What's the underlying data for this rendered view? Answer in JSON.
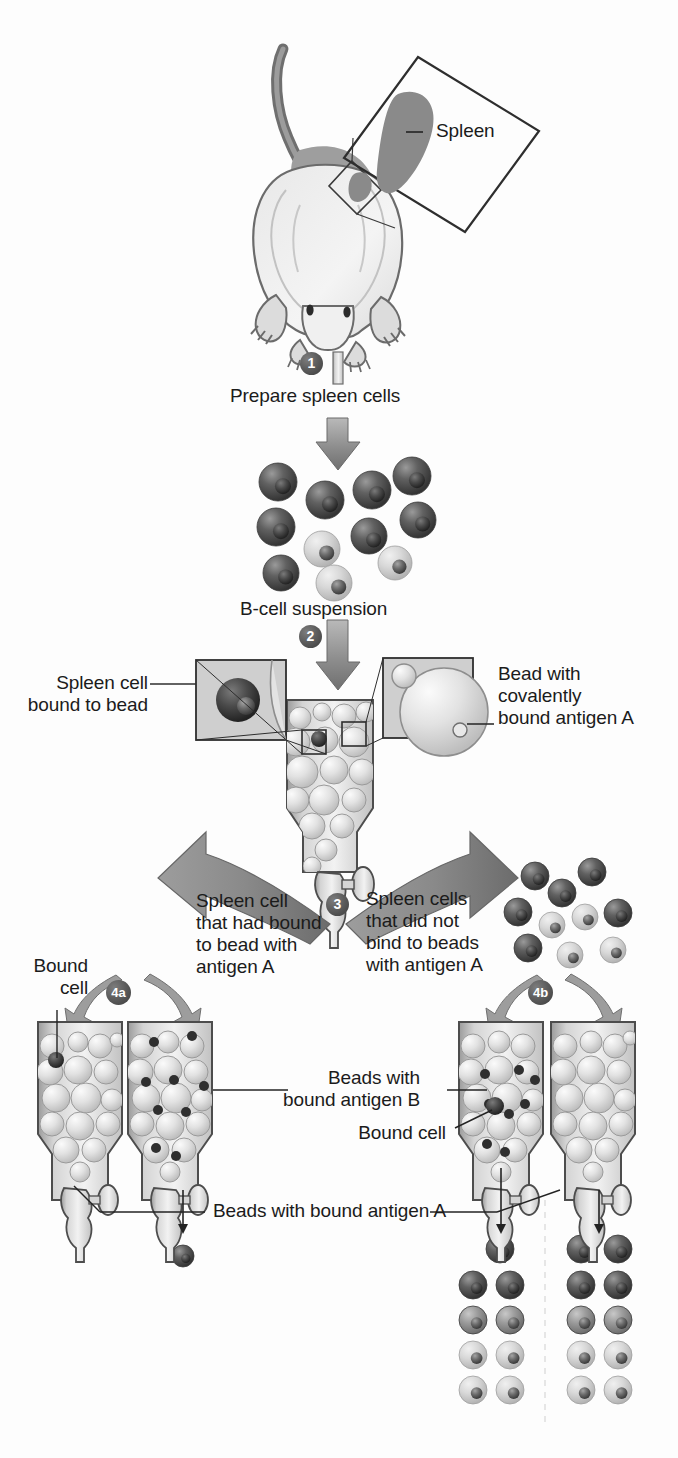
{
  "figure": {
    "background_color": "#fdfdfd",
    "ink_color": "#1b1b1b",
    "accent_gray": "#8a8a8a",
    "dark_cell_color": "#4a4a4a",
    "light_cell_color": "#d6d6d6",
    "bead_color": "#dcdcdc"
  },
  "labels": {
    "spleen": "Spleen",
    "prepare_spleen_cells": "Prepare spleen cells",
    "b_cell_suspension": "B-cell suspension",
    "spleen_cell_bound_to_bead": "Spleen cell\nbound to bead",
    "bead_with_covalently_bound_antigen_a": "Bead with\ncovalently\nbound antigen A",
    "spleen_cell_that_had_bound": "Spleen cell\nthat had bound\nto bead with\nantigen A",
    "spleen_cells_that_did_not_bind": "Spleen cells\nthat did not\nbind to beads\nwith antigen A",
    "bound_cell_left": "Bound\ncell",
    "bound_cell_right": "Bound cell",
    "beads_with_bound_antigen_b": "Beads with\nbound antigen B",
    "beads_with_bound_antigen_a": "Beads with bound antigen A"
  },
  "steps": [
    {
      "id": "1",
      "label": "1"
    },
    {
      "id": "2",
      "label": "2"
    },
    {
      "id": "3",
      "label": "3"
    },
    {
      "id": "4a",
      "label": "4a"
    },
    {
      "id": "4b",
      "label": "4b"
    }
  ],
  "suspension_cells": [
    {
      "x": 278,
      "y": 482,
      "r": 19,
      "tone": "dark"
    },
    {
      "x": 325,
      "y": 500,
      "r": 19,
      "tone": "dark"
    },
    {
      "x": 372,
      "y": 490,
      "r": 19,
      "tone": "dark"
    },
    {
      "x": 412,
      "y": 476,
      "r": 19,
      "tone": "dark"
    },
    {
      "x": 418,
      "y": 520,
      "r": 18,
      "tone": "dark"
    },
    {
      "x": 276,
      "y": 527,
      "r": 19,
      "tone": "dark"
    },
    {
      "x": 369,
      "y": 536,
      "r": 18,
      "tone": "dark"
    },
    {
      "x": 322,
      "y": 549,
      "r": 18,
      "tone": "light"
    },
    {
      "x": 281,
      "y": 573,
      "r": 18,
      "tone": "dark"
    },
    {
      "x": 334,
      "y": 583,
      "r": 18,
      "tone": "light"
    },
    {
      "x": 395,
      "y": 563,
      "r": 17,
      "tone": "light"
    }
  ],
  "unbound_cells": [
    {
      "x": 535,
      "y": 876,
      "r": 14,
      "tone": "dark"
    },
    {
      "x": 592,
      "y": 872,
      "r": 14,
      "tone": "dark"
    },
    {
      "x": 562,
      "y": 893,
      "r": 14,
      "tone": "dark"
    },
    {
      "x": 518,
      "y": 912,
      "r": 14,
      "tone": "dark"
    },
    {
      "x": 585,
      "y": 917,
      "r": 13,
      "tone": "light"
    },
    {
      "x": 552,
      "y": 925,
      "r": 13,
      "tone": "light"
    },
    {
      "x": 618,
      "y": 913,
      "r": 14,
      "tone": "dark"
    },
    {
      "x": 528,
      "y": 948,
      "r": 14,
      "tone": "dark"
    },
    {
      "x": 570,
      "y": 955,
      "r": 13,
      "tone": "light"
    },
    {
      "x": 613,
      "y": 950,
      "r": 13,
      "tone": "light"
    }
  ],
  "output_cells_left": [
    {
      "x": 183,
      "y": 1256,
      "r": 11,
      "tone": "dark"
    }
  ],
  "output_cells_center": [
    {
      "x": 500,
      "y": 1249,
      "r": 14,
      "tone": "dark"
    },
    {
      "x": 473,
      "y": 1285,
      "r": 14,
      "tone": "dark"
    },
    {
      "x": 510,
      "y": 1285,
      "r": 14,
      "tone": "dark"
    },
    {
      "x": 473,
      "y": 1320,
      "r": 14,
      "tone": "mid"
    },
    {
      "x": 510,
      "y": 1320,
      "r": 14,
      "tone": "mid"
    },
    {
      "x": 473,
      "y": 1355,
      "r": 14,
      "tone": "light"
    },
    {
      "x": 510,
      "y": 1355,
      "r": 14,
      "tone": "light"
    },
    {
      "x": 473,
      "y": 1390,
      "r": 14,
      "tone": "light"
    },
    {
      "x": 510,
      "y": 1390,
      "r": 14,
      "tone": "light"
    }
  ],
  "output_cells_right": [
    {
      "x": 581,
      "y": 1249,
      "r": 14,
      "tone": "dark"
    },
    {
      "x": 618,
      "y": 1249,
      "r": 14,
      "tone": "dark"
    },
    {
      "x": 581,
      "y": 1285,
      "r": 14,
      "tone": "dark"
    },
    {
      "x": 618,
      "y": 1285,
      "r": 14,
      "tone": "dark"
    },
    {
      "x": 581,
      "y": 1320,
      "r": 14,
      "tone": "mid"
    },
    {
      "x": 618,
      "y": 1320,
      "r": 14,
      "tone": "mid"
    },
    {
      "x": 581,
      "y": 1355,
      "r": 14,
      "tone": "light"
    },
    {
      "x": 618,
      "y": 1355,
      "r": 14,
      "tone": "light"
    },
    {
      "x": 581,
      "y": 1390,
      "r": 14,
      "tone": "light"
    },
    {
      "x": 618,
      "y": 1390,
      "r": 14,
      "tone": "light"
    }
  ],
  "columns": [
    {
      "id": "col-4a-left",
      "x": 38,
      "y": 1018,
      "bound_cells": 1,
      "bead_antigen": "A"
    },
    {
      "id": "col-4a-right",
      "x": 128,
      "y": 1018,
      "bound_cells": 8,
      "bead_antigen": "B"
    },
    {
      "id": "col-4b-left",
      "x": 459,
      "y": 1018,
      "bound_cells": 8,
      "bead_antigen": "A"
    },
    {
      "id": "col-4b-right",
      "x": 551,
      "y": 1018,
      "bound_cells": 0,
      "bead_antigen": "B"
    }
  ]
}
